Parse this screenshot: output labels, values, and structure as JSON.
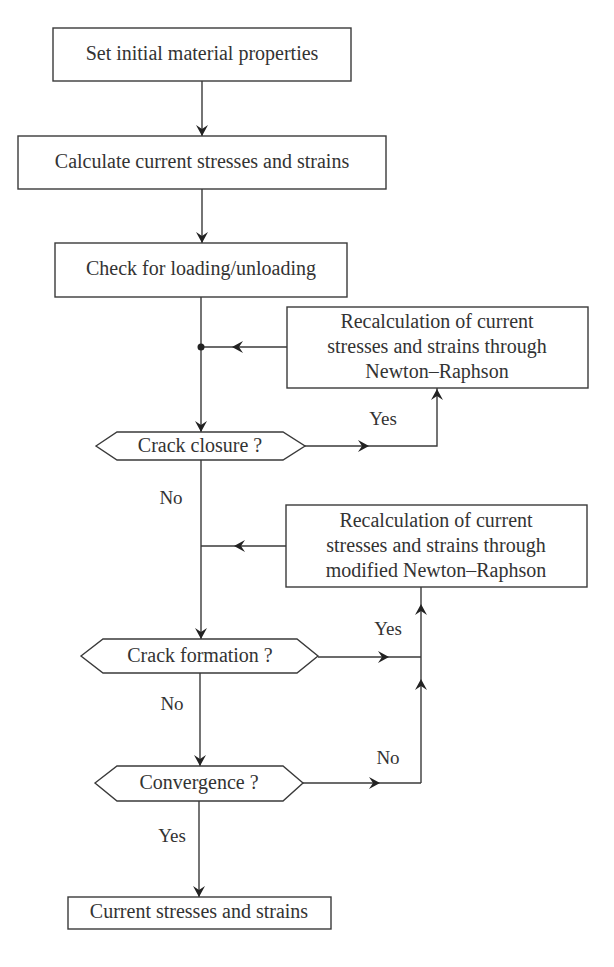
{
  "diagram": {
    "type": "flowchart",
    "nodes": {
      "set_initial": {
        "shape": "process",
        "label": "Set initial material properties"
      },
      "calc_current": {
        "shape": "process",
        "label": "Calculate current stresses and strains"
      },
      "check_loading": {
        "shape": "process",
        "label": "Check for loading/unloading"
      },
      "recalc_nr": {
        "shape": "process",
        "lines": [
          "Recalculation of current",
          "stresses and strains through",
          "Newton–Raphson"
        ]
      },
      "crack_closure": {
        "shape": "decision",
        "label": "Crack closure ?"
      },
      "recalc_mnr": {
        "shape": "process",
        "lines": [
          "Recalculation of current",
          "stresses and strains through",
          "modified Newton–Raphson"
        ]
      },
      "crack_formation": {
        "shape": "decision",
        "label": "Crack formation ?"
      },
      "convergence": {
        "shape": "decision",
        "label": "Convergence ?"
      },
      "current_final": {
        "shape": "process",
        "label": "Current stresses and strains"
      }
    },
    "edge_labels": {
      "closure_yes": "Yes",
      "closure_no": "No",
      "formation_yes": "Yes",
      "formation_no": "No",
      "convergence_no": "No",
      "convergence_yes": "Yes"
    },
    "edges": [
      {
        "from": "set_initial",
        "to": "calc_current"
      },
      {
        "from": "calc_current",
        "to": "check_loading"
      },
      {
        "from": "check_loading",
        "to": "crack_closure"
      },
      {
        "from": "recalc_nr",
        "to": "crack_closure",
        "via": "junction"
      },
      {
        "from": "crack_closure",
        "to": "recalc_nr",
        "label": "Yes"
      },
      {
        "from": "crack_closure",
        "to": "crack_formation",
        "label": "No"
      },
      {
        "from": "recalc_mnr",
        "to": "crack_formation",
        "via": "junction"
      },
      {
        "from": "crack_formation",
        "to": "recalc_mnr",
        "label": "Yes"
      },
      {
        "from": "crack_formation",
        "to": "convergence",
        "label": "No"
      },
      {
        "from": "convergence",
        "to": "recalc_mnr",
        "label": "No"
      },
      {
        "from": "convergence",
        "to": "current_final",
        "label": "Yes"
      }
    ],
    "colors": {
      "stroke": "#3a3a3a",
      "text": "#333333",
      "background": "#ffffff"
    }
  }
}
